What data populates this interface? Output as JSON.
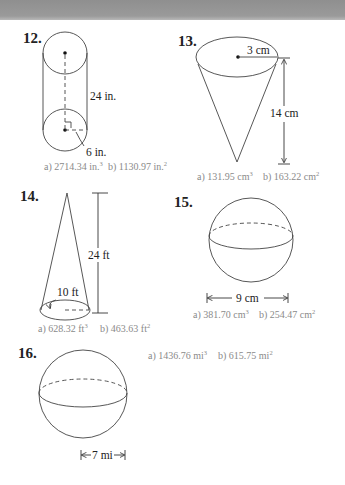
{
  "header": {
    "band_color": "#999999"
  },
  "problems": [
    {
      "number": "12.",
      "shape": "cylinder",
      "labels": {
        "height": "24 in.",
        "radius": "6 in."
      },
      "answers": {
        "a_prefix": "a)",
        "a_value": "2714.34 in.",
        "a_exp": "3",
        "b_prefix": "b)",
        "b_value": "1130.97 in.",
        "b_exp": "2"
      }
    },
    {
      "number": "13.",
      "shape": "cone-inverted",
      "labels": {
        "radius": "3 cm",
        "height": "14 cm"
      },
      "answers": {
        "a_prefix": "a)",
        "a_value": "131.95 cm",
        "a_exp": "3",
        "b_prefix": "b)",
        "b_value": "163.22 cm",
        "b_exp": "2"
      }
    },
    {
      "number": "14.",
      "shape": "cone",
      "labels": {
        "height": "24 ft",
        "radius": "10 ft"
      },
      "answers": {
        "a_prefix": "a)",
        "a_value": "628.32 ft",
        "a_exp": "3",
        "b_prefix": "b)",
        "b_value": "463.63 ft",
        "b_exp": "2"
      }
    },
    {
      "number": "15.",
      "shape": "sphere",
      "labels": {
        "diameter": "9 cm"
      },
      "answers": {
        "a_prefix": "a)",
        "a_value": "381.70 cm",
        "a_exp": "3",
        "b_prefix": "b)",
        "b_value": "254.47 cm",
        "b_exp": "2"
      }
    },
    {
      "number": "16.",
      "shape": "sphere",
      "labels": {
        "radius": "7 mi"
      },
      "answers": {
        "a_prefix": "a)",
        "a_value": "1436.76 mi",
        "a_exp": "3",
        "b_prefix": "b)",
        "b_value": "615.75 mi",
        "b_exp": "2"
      }
    }
  ],
  "colors": {
    "line": "#444444",
    "text": "#222222",
    "answer_text": "#8a8a8a"
  }
}
